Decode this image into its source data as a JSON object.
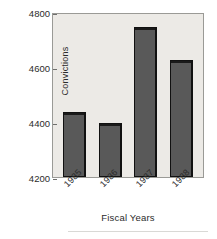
{
  "chart_data": {
    "type": "bar",
    "title": "",
    "xlabel": "Fiscal Years",
    "ylabel": "Convictions",
    "categories": [
      "1985",
      "1986",
      "1987",
      "1988"
    ],
    "values": [
      4435,
      4395,
      4745,
      4625
    ],
    "ylim": [
      4200,
      4800
    ],
    "ytick_labels": [
      "4800",
      "4600",
      "4400",
      "4200"
    ],
    "ytick_values": [
      4800,
      4600,
      4400,
      4200
    ],
    "ytick_step": 200,
    "grid": false,
    "legend": null,
    "series": [
      {
        "name": "Convictions",
        "values": [
          4435,
          4395,
          4745,
          4625
        ]
      }
    ],
    "colors": {
      "bar_fill": "#595959",
      "bar_outline": "#111111",
      "plot_background": "#eceae6",
      "frame": "#9a9a96",
      "text": "#2b2b2b",
      "page_background": "#ffffff"
    },
    "annotations": []
  }
}
